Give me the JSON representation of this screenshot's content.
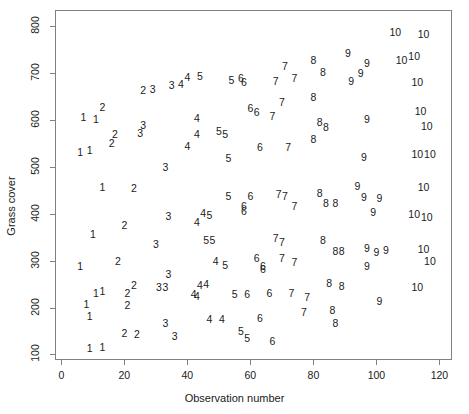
{
  "chart_data": {
    "type": "scatter",
    "title": "",
    "subtitle": "",
    "xlabel": "Observation number",
    "ylabel": "Grass cover",
    "xlim": [
      -2,
      124
    ],
    "ylim": [
      88,
      835
    ],
    "xticks": [
      0,
      20,
      40,
      60,
      80,
      100,
      120
    ],
    "yticks": [
      100,
      200,
      300,
      400,
      500,
      600,
      700,
      800
    ],
    "grid": false,
    "legend": null,
    "point_marker": "group-number-text",
    "note": "Each plotted point is drawn as the text of its group number (1-10) rather than a symbol. Groups occupy successive ranges of observation number and grass cover trends upward with observation number.",
    "series": [
      {
        "name": "group-1",
        "label": "1",
        "points": [
          [
            7,
            607
          ],
          [
            11,
            602
          ],
          [
            6,
            533
          ],
          [
            9,
            537
          ],
          [
            13,
            457
          ],
          [
            10,
            357
          ],
          [
            6,
            288
          ],
          [
            11,
            232
          ],
          [
            13,
            236
          ],
          [
            8,
            207
          ],
          [
            9,
            183
          ],
          [
            9,
            114
          ],
          [
            13,
            116
          ]
        ]
      },
      {
        "name": "group-2",
        "label": "2",
        "points": [
          [
            13,
            628
          ],
          [
            26,
            664
          ],
          [
            17,
            571
          ],
          [
            16,
            552
          ],
          [
            23,
            456
          ],
          [
            20,
            377
          ],
          [
            18,
            300
          ],
          [
            21,
            232
          ],
          [
            23,
            248
          ],
          [
            21,
            205
          ],
          [
            20,
            146
          ],
          [
            24,
            143
          ]
        ]
      },
      {
        "name": "group-3",
        "label": "3",
        "points": [
          [
            29,
            666
          ],
          [
            35,
            676
          ],
          [
            26,
            590
          ],
          [
            25,
            573
          ],
          [
            33,
            500
          ],
          [
            34,
            396
          ],
          [
            30,
            336
          ],
          [
            34,
            272
          ],
          [
            31,
            243
          ],
          [
            33,
            243
          ],
          [
            33,
            167
          ],
          [
            36,
            140
          ]
        ]
      },
      {
        "name": "group-4",
        "label": "4",
        "points": [
          [
            40,
            692
          ],
          [
            38,
            677
          ],
          [
            43,
            604
          ],
          [
            43,
            571
          ],
          [
            40,
            545
          ],
          [
            45,
            402
          ],
          [
            43,
            382
          ],
          [
            49,
            299
          ],
          [
            44,
            248
          ],
          [
            46,
            251
          ],
          [
            42,
            230
          ],
          [
            43,
            224
          ],
          [
            47,
            176
          ],
          [
            51,
            176
          ]
        ]
      },
      {
        "name": "group-5",
        "label": "5",
        "points": [
          [
            44,
            694
          ],
          [
            54,
            685
          ],
          [
            50,
            576
          ],
          [
            52,
            570
          ],
          [
            53,
            520
          ],
          [
            53,
            438
          ],
          [
            47,
            398
          ],
          [
            48,
            345
          ],
          [
            46,
            344
          ],
          [
            52,
            290
          ],
          [
            55,
            228
          ],
          [
            57,
            150
          ],
          [
            59,
            135
          ]
        ]
      },
      {
        "name": "group-6",
        "label": "6",
        "points": [
          [
            57,
            691
          ],
          [
            60,
            627
          ],
          [
            62,
            617
          ],
          [
            58,
            681
          ],
          [
            63,
            542
          ],
          [
            60,
            438
          ],
          [
            58,
            417
          ],
          [
            58,
            407
          ],
          [
            62,
            305
          ],
          [
            64,
            288
          ],
          [
            64,
            282
          ],
          [
            59,
            230
          ],
          [
            66,
            232
          ],
          [
            63,
            178
          ],
          [
            67,
            128
          ]
        ]
      },
      {
        "name": "group-7",
        "label": "7",
        "points": [
          [
            71,
            715
          ],
          [
            68,
            683
          ],
          [
            74,
            690
          ],
          [
            70,
            638
          ],
          [
            67,
            608
          ],
          [
            72,
            542
          ],
          [
            69,
            443
          ],
          [
            71,
            438
          ],
          [
            74,
            417
          ],
          [
            68,
            349
          ],
          [
            70,
            340
          ],
          [
            70,
            305
          ],
          [
            74,
            297
          ],
          [
            73,
            231
          ],
          [
            78,
            222
          ],
          [
            77,
            191
          ]
        ]
      },
      {
        "name": "group-8",
        "label": "8",
        "points": [
          [
            80,
            729
          ],
          [
            83,
            702
          ],
          [
            80,
            649
          ],
          [
            82,
            596
          ],
          [
            84,
            585
          ],
          [
            80,
            560
          ],
          [
            82,
            444
          ],
          [
            84,
            424
          ],
          [
            87,
            423
          ],
          [
            83,
            344
          ],
          [
            87,
            320
          ],
          [
            89,
            320
          ],
          [
            85,
            252
          ],
          [
            89,
            245
          ],
          [
            86,
            195
          ],
          [
            87,
            168
          ]
        ]
      },
      {
        "name": "group-9",
        "label": "9",
        "points": [
          [
            91,
            744
          ],
          [
            97,
            722
          ],
          [
            95,
            701
          ],
          [
            92,
            684
          ],
          [
            97,
            603
          ],
          [
            96,
            521
          ],
          [
            94,
            460
          ],
          [
            96,
            435
          ],
          [
            101,
            434
          ],
          [
            99,
            404
          ],
          [
            97,
            327
          ],
          [
            103,
            322
          ],
          [
            100,
            318
          ],
          [
            97,
            288
          ],
          [
            101,
            214
          ]
        ]
      },
      {
        "name": "group-10",
        "label": "10",
        "points": [
          [
            106,
            788
          ],
          [
            115,
            783
          ],
          [
            112,
            737
          ],
          [
            108,
            729
          ],
          [
            113,
            682
          ],
          [
            114,
            620
          ],
          [
            116,
            587
          ],
          [
            113,
            527
          ],
          [
            117,
            527
          ],
          [
            115,
            458
          ],
          [
            112,
            400
          ],
          [
            116,
            393
          ],
          [
            115,
            324
          ],
          [
            117,
            300
          ],
          [
            113,
            243
          ]
        ]
      }
    ]
  },
  "axes": {
    "x_tick_labels": [
      "0",
      "20",
      "40",
      "60",
      "80",
      "100",
      "120"
    ],
    "y_tick_labels": [
      "100",
      "200",
      "300",
      "400",
      "500",
      "600",
      "700",
      "800"
    ],
    "x_axis_title": "Observation number",
    "y_axis_title": "Grass cover"
  },
  "style": {
    "frame_color": "#808080",
    "text_color": "#1a1a1a",
    "background": "#ffffff"
  }
}
